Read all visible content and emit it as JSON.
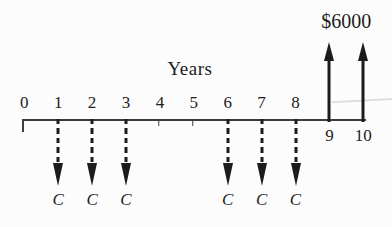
{
  "figure": {
    "kind": "cash-flow-diagram",
    "axis_label": "Years",
    "receipt_label": "$6000",
    "cost_label": "C"
  },
  "colors": {
    "ink": "#1c1c1c",
    "axis": "#3d3d3d",
    "text": "#1d1d1d",
    "background": "#fcfcfc",
    "artifact": "#dedede"
  },
  "chart_data": {
    "type": "cashflow-timeline",
    "axis_label": "Years",
    "axis_years": [
      0,
      1,
      2,
      3,
      4,
      5,
      6,
      7,
      8,
      9,
      10
    ],
    "years_labeled_above_axis": [
      0,
      1,
      2,
      3,
      4,
      5,
      6,
      7,
      8
    ],
    "years_labeled_below_axis": [
      9,
      10
    ],
    "minor_tick_years": [
      0,
      4,
      5
    ],
    "series": [
      {
        "name": "annual-cost",
        "direction": "down",
        "line_style": "dashed",
        "years": [
          1,
          2,
          3,
          6,
          7,
          8
        ],
        "value_label": "C"
      },
      {
        "name": "future-receipt",
        "direction": "up",
        "line_style": "solid",
        "years": [
          9,
          10
        ],
        "value_label": "$6000",
        "amount": 6000
      }
    ]
  }
}
